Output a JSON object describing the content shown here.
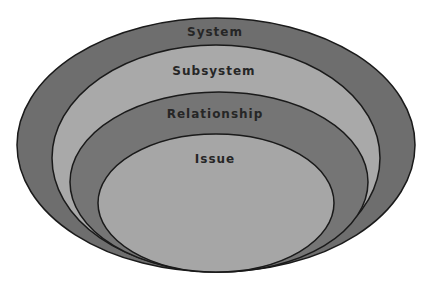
{
  "diagram": {
    "type": "nested-ellipses",
    "layers": [
      {
        "label": "System",
        "fill": "#6e6e6e"
      },
      {
        "label": "Subsystem",
        "fill": "#a9a9a9"
      },
      {
        "label": "Relationship",
        "fill": "#757575"
      },
      {
        "label": "Issue",
        "fill": "#a6a6a6"
      }
    ],
    "outline_color": "#1a1a1a"
  }
}
